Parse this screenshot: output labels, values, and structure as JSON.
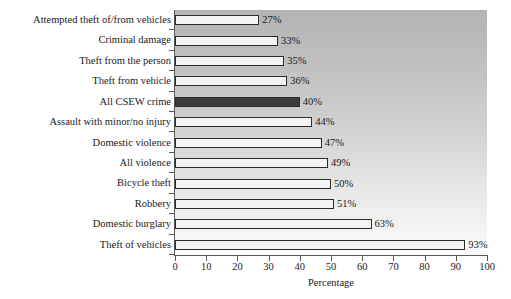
{
  "chart_data": {
    "type": "bar",
    "orientation": "horizontal",
    "title": "",
    "xlabel": "Percentage",
    "ylabel": "",
    "xlim": [
      0,
      100
    ],
    "xticks": [
      0,
      10,
      20,
      30,
      40,
      50,
      60,
      70,
      80,
      90,
      100
    ],
    "xtick_labels": [
      "0",
      "10",
      "20",
      "30",
      "40",
      "50",
      "60",
      "70",
      "80",
      "90",
      "100"
    ],
    "grid": false,
    "legend": null,
    "categories": [
      "Attempted theft of/from vehicles",
      "Criminal damage",
      "Theft from the person",
      "Theft from vehicle",
      "All CSEW crime",
      "Assault with minor/no injury",
      "Domestic violence",
      "All violence",
      "Bicycle theft",
      "Robbery",
      "Domestic burglary",
      "Theft of vehicles"
    ],
    "values": [
      27,
      33,
      35,
      36,
      40,
      44,
      47,
      49,
      50,
      51,
      63,
      93
    ],
    "value_labels": [
      "27%",
      "33%",
      "35%",
      "36%",
      "40%",
      "44%",
      "47%",
      "49%",
      "50%",
      "51%",
      "63%",
      "93%"
    ],
    "highlight_index": 4,
    "colors": {
      "bar_fill": "#f4f4f4",
      "bar_edge": "#2b2b2b",
      "bar_highlight_fill": "#3c3c3c",
      "plot_background_top": "#b4b4b4",
      "plot_background_bottom": "#fbfbfb",
      "axis": "#575757",
      "text": "#1a1a1a",
      "page_background": "#ffffff"
    }
  }
}
